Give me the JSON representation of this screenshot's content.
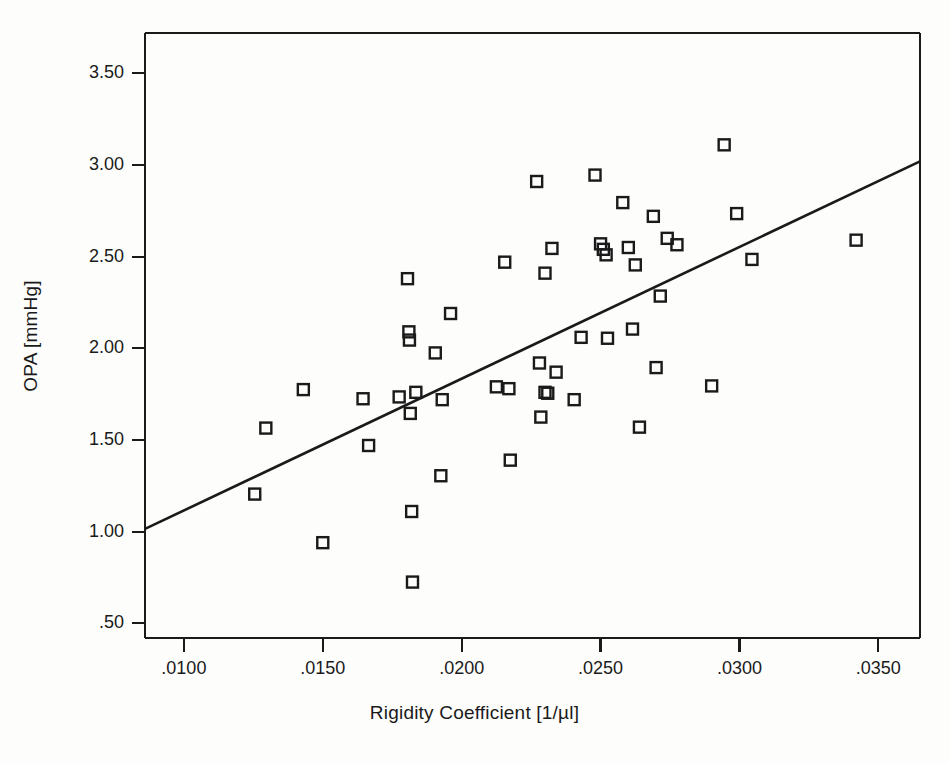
{
  "chart_data": {
    "type": "scatter",
    "title": "",
    "xlabel": "Rigidity Coefficient [1/µl]",
    "ylabel": "OPA [mmHg]",
    "xlim": [
      0.0086,
      0.0365
    ],
    "ylim": [
      0.42,
      3.72
    ],
    "grid": false,
    "legend": null,
    "xticks": [
      0.01,
      0.015,
      0.02,
      0.025,
      0.03,
      0.035
    ],
    "xticklabels": [
      ".0100",
      ".0150",
      ".0200",
      ".0250",
      ".0300",
      ".0350"
    ],
    "yticks": [
      0.5,
      1.0,
      1.5,
      2.0,
      2.5,
      3.0,
      3.5
    ],
    "yticklabels": [
      ".50",
      "1.00",
      "1.50",
      "2.00",
      "2.50",
      "3.00",
      "3.50"
    ],
    "marker": "open-square",
    "marker_color": "#1a1a1a",
    "marker_size": 11,
    "points": [
      {
        "x": 0.01255,
        "y": 1.205
      },
      {
        "x": 0.01295,
        "y": 1.565
      },
      {
        "x": 0.0143,
        "y": 1.775
      },
      {
        "x": 0.015,
        "y": 0.94
      },
      {
        "x": 0.01645,
        "y": 1.725
      },
      {
        "x": 0.01665,
        "y": 1.47
      },
      {
        "x": 0.01775,
        "y": 1.735
      },
      {
        "x": 0.01805,
        "y": 2.38
      },
      {
        "x": 0.0181,
        "y": 2.09
      },
      {
        "x": 0.01812,
        "y": 2.045
      },
      {
        "x": 0.01815,
        "y": 1.645
      },
      {
        "x": 0.0182,
        "y": 1.11
      },
      {
        "x": 0.01823,
        "y": 0.725
      },
      {
        "x": 0.01835,
        "y": 1.76
      },
      {
        "x": 0.01905,
        "y": 1.975
      },
      {
        "x": 0.01925,
        "y": 1.305
      },
      {
        "x": 0.0193,
        "y": 1.72
      },
      {
        "x": 0.0196,
        "y": 2.19
      },
      {
        "x": 0.02125,
        "y": 1.79
      },
      {
        "x": 0.02155,
        "y": 2.47
      },
      {
        "x": 0.0217,
        "y": 1.78
      },
      {
        "x": 0.02175,
        "y": 1.39
      },
      {
        "x": 0.0227,
        "y": 2.91
      },
      {
        "x": 0.0228,
        "y": 1.92
      },
      {
        "x": 0.02285,
        "y": 1.625
      },
      {
        "x": 0.023,
        "y": 2.41
      },
      {
        "x": 0.023,
        "y": 1.76
      },
      {
        "x": 0.0231,
        "y": 1.755
      },
      {
        "x": 0.02325,
        "y": 2.545
      },
      {
        "x": 0.0234,
        "y": 1.87
      },
      {
        "x": 0.02405,
        "y": 1.72
      },
      {
        "x": 0.0243,
        "y": 2.06
      },
      {
        "x": 0.0248,
        "y": 2.945
      },
      {
        "x": 0.025,
        "y": 2.57
      },
      {
        "x": 0.0251,
        "y": 2.54
      },
      {
        "x": 0.0252,
        "y": 2.51
      },
      {
        "x": 0.02525,
        "y": 2.055
      },
      {
        "x": 0.0258,
        "y": 2.795
      },
      {
        "x": 0.026,
        "y": 2.55
      },
      {
        "x": 0.02615,
        "y": 2.105
      },
      {
        "x": 0.02625,
        "y": 2.455
      },
      {
        "x": 0.0264,
        "y": 1.57
      },
      {
        "x": 0.0269,
        "y": 2.72
      },
      {
        "x": 0.027,
        "y": 1.895
      },
      {
        "x": 0.02715,
        "y": 2.285
      },
      {
        "x": 0.0274,
        "y": 2.6
      },
      {
        "x": 0.02775,
        "y": 2.565
      },
      {
        "x": 0.029,
        "y": 1.795
      },
      {
        "x": 0.02945,
        "y": 3.11
      },
      {
        "x": 0.0299,
        "y": 2.735
      },
      {
        "x": 0.03045,
        "y": 2.485
      },
      {
        "x": 0.0342,
        "y": 2.59
      }
    ],
    "fit_line": {
      "label": "",
      "color": "#1a1a1a",
      "x_start": 0.0086,
      "y_start": 1.015,
      "x_end": 0.0365,
      "y_end": 3.02
    }
  }
}
